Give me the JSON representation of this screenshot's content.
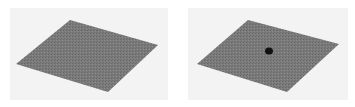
{
  "figure": {
    "panels": [
      {
        "name": "plain-plane",
        "has_dot": false
      },
      {
        "name": "plane-with-dot",
        "has_dot": true
      }
    ],
    "colors": {
      "background": "#ffffff",
      "panel_background": "#f3f3f3",
      "plane": "#7a7a7a",
      "plane_texture": "#6a6a6a",
      "dot": "#111111"
    }
  }
}
